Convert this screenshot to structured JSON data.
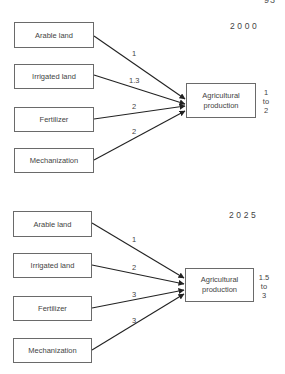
{
  "page_number": "93",
  "diagrams": [
    {
      "year": "2000",
      "inputs": [
        {
          "label": "Arable land",
          "weight": "1"
        },
        {
          "label": "Irrigated land",
          "weight": "1.3"
        },
        {
          "label": "Fertilizer",
          "weight": "2"
        },
        {
          "label": "Mechanization",
          "weight": "2"
        }
      ],
      "output": {
        "label_line1": "Agricultural",
        "label_line2": "production"
      },
      "range": {
        "low": "1",
        "to": "to",
        "high": "2"
      }
    },
    {
      "year": "2025",
      "inputs": [
        {
          "label": "Arable land",
          "weight": "1"
        },
        {
          "label": "Irrigated land",
          "weight": "2"
        },
        {
          "label": "Fertilizer",
          "weight": "3"
        },
        {
          "label": "Mechanization",
          "weight": "3"
        }
      ],
      "output": {
        "label_line1": "Agricultural",
        "label_line2": "production"
      },
      "range": {
        "low": "1.5",
        "to": "to",
        "high": "3"
      }
    }
  ],
  "colors": {
    "line": "#222222",
    "box_border": "#6a6a6a",
    "text": "#444444"
  }
}
